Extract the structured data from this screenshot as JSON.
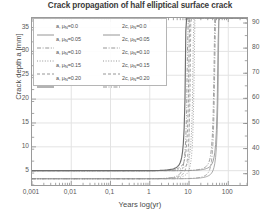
{
  "chart_data": {
    "type": "line",
    "title": "Crack propagation of half elliptical surface crack",
    "xlabel": "Years log(yr)",
    "ylabel_left": "Crack depth a [mm]",
    "ylabel_right": "Crack width 2c [mm]",
    "xscale": "log",
    "xlim": [
      0.001,
      300
    ],
    "xticks": [
      0.001,
      0.01,
      0.1,
      1,
      10,
      100
    ],
    "xticklabels": [
      "0,001",
      "0,01",
      "0,1",
      "1",
      "10",
      "100"
    ],
    "ylim_left": [
      2,
      37
    ],
    "yticks_left": [
      5,
      10,
      15,
      20,
      25,
      30,
      35
    ],
    "yticklabels_left": [
      "5",
      "10",
      "15",
      "20",
      "25",
      "30",
      "35"
    ],
    "ylim_right": [
      25.5,
      92
    ],
    "yticks_right": [
      30,
      40,
      50,
      60,
      70,
      80,
      90
    ],
    "yticklabels_right": [
      "30",
      "40",
      "50",
      "60",
      "70",
      "80",
      "90"
    ],
    "grid": true,
    "legend_position": "upper left",
    "legend_columns": 2,
    "series": [
      {
        "name": "a, μ_N=0.0",
        "label": "a, ",
        "sub": "N",
        "tail": "=0.0",
        "axis": "left",
        "style": "solid",
        "color": "#8f8f8f",
        "knee_year": 60,
        "y_start": 5.0,
        "y_end": 37.0
      },
      {
        "name": "a, μ_N=0.05",
        "label": "a, ",
        "sub": "N",
        "tail": "=0.05",
        "axis": "left",
        "style": "dashdot",
        "color": "#8f8f8f",
        "knee_year": 48,
        "y_start": 5.0,
        "y_end": 37.0
      },
      {
        "name": "a, μ_N=0.10",
        "label": "a, ",
        "sub": "N",
        "tail": "=0.10",
        "axis": "left",
        "style": "dotted",
        "color": "#8f8f8f",
        "knee_year": 14,
        "y_start": 5.0,
        "y_end": 37.0
      },
      {
        "name": "a, μ_N=0.15",
        "label": "a, ",
        "sub": "N",
        "tail": "=0.15",
        "axis": "left",
        "style": "dashed",
        "color": "#8f8f8f",
        "knee_year": 11,
        "y_start": 5.0,
        "y_end": 37.0
      },
      {
        "name": "a, μ_N=0.20",
        "label": "a, ",
        "sub": "N",
        "tail": "=0.20",
        "axis": "left",
        "style": "solid-thick",
        "color": "#6e6e6e",
        "knee_year": 9,
        "y_start": 5.0,
        "y_end": 37.0
      },
      {
        "name": "2c, μ_N=0.0",
        "label": "2c, ",
        "sub": "N",
        "tail": "=0.0",
        "axis": "right",
        "style": "solid",
        "color": "#9a9a9a",
        "knee_year": 62,
        "y_start": 28.0,
        "y_end": 92.0
      },
      {
        "name": "2c, μ_N=0.05",
        "label": "2c, ",
        "sub": "N",
        "tail": "=0.05",
        "axis": "right",
        "style": "dashdot",
        "color": "#9a9a9a",
        "knee_year": 50,
        "y_start": 28.0,
        "y_end": 92.0
      },
      {
        "name": "2c, μ_N=0.10",
        "label": "2c, ",
        "sub": "N",
        "tail": "=0.10",
        "axis": "right",
        "style": "dotted",
        "color": "#9a9a9a",
        "knee_year": 15,
        "y_start": 28.0,
        "y_end": 92.0
      },
      {
        "name": "2c, μ_N=0.15",
        "label": "2c, ",
        "sub": "N",
        "tail": "=0.15",
        "axis": "right",
        "style": "dashed",
        "color": "#9a9a9a",
        "knee_year": 12,
        "y_start": 28.0,
        "y_end": 92.0
      },
      {
        "name": "2c, μ_N=0.20",
        "label": "2c, ",
        "sub": "N",
        "tail": "=0.20",
        "axis": "right",
        "style": "dashdotdot",
        "color": "#8a8a8a",
        "knee_year": 10,
        "y_start": 28.0,
        "y_end": 92.0
      }
    ]
  },
  "legend": {
    "rows": [
      {
        "left": {
          "label": "a, ",
          "sub": "N",
          "tail": "=0.0",
          "style": "solid"
        },
        "right": {
          "label": "2c, ",
          "sub": "N",
          "tail": "=0.0",
          "style": "solid"
        }
      },
      {
        "left": {
          "label": "a, ",
          "sub": "N",
          "tail": "=0.05",
          "style": "dashdot"
        },
        "right": {
          "label": "2c, ",
          "sub": "N",
          "tail": "=0.05",
          "style": "dashdot"
        }
      },
      {
        "left": {
          "label": "a, ",
          "sub": "N",
          "tail": "=0.10",
          "style": "dotted"
        },
        "right": {
          "label": "2c, ",
          "sub": "N",
          "tail": "=0.10",
          "style": "dotted"
        }
      },
      {
        "left": {
          "label": "a, ",
          "sub": "N",
          "tail": "=0.15",
          "style": "dashed"
        },
        "right": {
          "label": "2c, ",
          "sub": "N",
          "tail": "=0.15",
          "style": "dashed"
        }
      },
      {
        "left": {
          "label": "a, ",
          "sub": "N",
          "tail": "=0.20",
          "style": "solid-thick"
        },
        "right": {
          "label": "2c, ",
          "sub": "N",
          "tail": "=0.20",
          "style": "dashdotdot"
        }
      }
    ]
  },
  "colors": {
    "frame": "#9a9a9a",
    "grid": "#e3e3e3",
    "text": "#4a4a4a",
    "background": "#ffffff"
  }
}
